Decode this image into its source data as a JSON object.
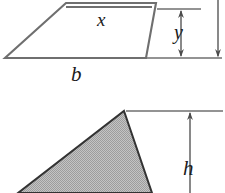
{
  "figure": {
    "background_color": "#ffffff",
    "stroke_color": "#595959",
    "dark_stroke_color": "#3d3d3d",
    "fill_gray": "#b4b4b4",
    "shapes": [
      {
        "name": "parallelogram",
        "description": "Parallelogram with base b, interior segment x, and height y",
        "fill": "none",
        "stroke": "#6b6b6b"
      },
      {
        "name": "triangle",
        "description": "Gray shaded triangle with height h",
        "fill": "#b4b4b4",
        "stroke": "#333333"
      }
    ],
    "labels": {
      "x": "x",
      "b": "b",
      "y": "y",
      "h": "h"
    },
    "dimensions": [
      {
        "name": "y-dimension",
        "label": "y",
        "orientation": "vertical",
        "arrowheads": "both"
      },
      {
        "name": "total-height-dimension",
        "label": "",
        "orientation": "vertical",
        "arrowheads": "bottom"
      },
      {
        "name": "h-dimension",
        "label": "h",
        "orientation": "vertical",
        "arrowheads": "top"
      }
    ]
  }
}
